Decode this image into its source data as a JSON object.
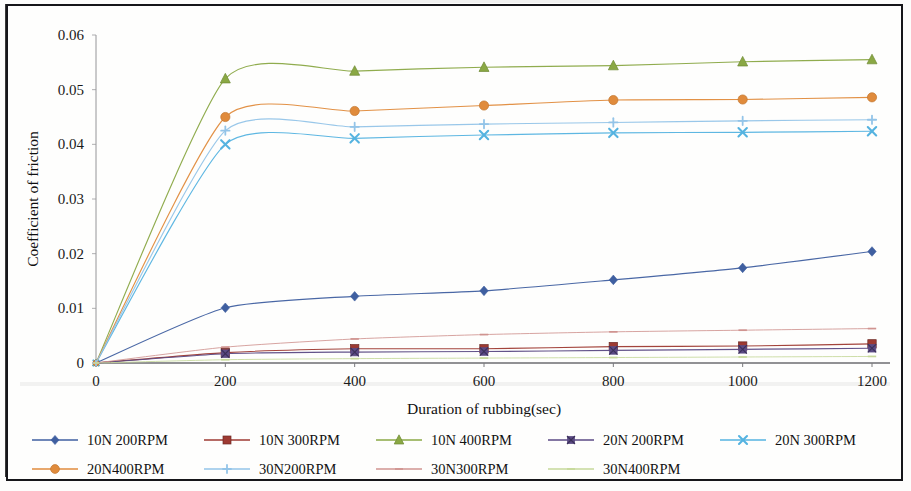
{
  "chart_data": {
    "type": "line",
    "title": "",
    "xlabel": "Duration of rubbing(sec)",
    "ylabel": "Coefficient of friction",
    "x": [
      0,
      200,
      400,
      600,
      800,
      1000,
      1200
    ],
    "xlim": [
      0,
      1200
    ],
    "ylim": [
      0,
      0.06
    ],
    "xticks": [
      "0",
      "200",
      "400",
      "600",
      "800",
      "1000",
      "1200"
    ],
    "yticks": [
      "0",
      "0.01",
      "0.02",
      "0.03",
      "0.04",
      "0.05",
      "0.06"
    ],
    "xtick_values": [
      0,
      200,
      400,
      600,
      800,
      1000,
      1200
    ],
    "ytick_values": [
      0,
      0.01,
      0.02,
      0.03,
      0.04,
      0.05,
      0.06
    ],
    "grid": false,
    "legend_position": "bottom",
    "smoothed": true,
    "series": [
      {
        "name": "10N 200RPM",
        "color": "#3f5fa0",
        "marker": "diamond",
        "values": [
          0,
          0.0101,
          0.0122,
          0.0132,
          0.0152,
          0.0174,
          0.0204
        ]
      },
      {
        "name": "10N 300RPM",
        "color": "#9e3a32",
        "marker": "square",
        "values": [
          0,
          0.0019,
          0.0026,
          0.0026,
          0.003,
          0.0031,
          0.0035
        ]
      },
      {
        "name": "10N 400RPM",
        "color": "#8aa844",
        "marker": "triangle",
        "values": [
          0,
          0.052,
          0.0534,
          0.0541,
          0.0544,
          0.0551,
          0.0555
        ]
      },
      {
        "name": "20N 200RPM",
        "color": "#5b4a84",
        "marker": "x-square",
        "values": [
          0,
          0.0017,
          0.002,
          0.0021,
          0.0023,
          0.0025,
          0.0027
        ]
      },
      {
        "name": "20N 300RPM",
        "color": "#55b3e0",
        "marker": "x",
        "values": [
          0,
          0.04,
          0.0411,
          0.0417,
          0.0421,
          0.0422,
          0.0424
        ]
      },
      {
        "name": "20N400RPM",
        "color": "#e08b3c",
        "marker": "circle",
        "values": [
          0,
          0.045,
          0.0461,
          0.0471,
          0.0481,
          0.0482,
          0.0486
        ]
      },
      {
        "name": "30N200RPM",
        "color": "#93c4e8",
        "marker": "plus",
        "values": [
          0,
          0.0425,
          0.0432,
          0.0437,
          0.044,
          0.0443,
          0.0445
        ]
      },
      {
        "name": "30N300RPM",
        "color": "#d09490",
        "marker": "dash",
        "values": [
          0,
          0.0029,
          0.0044,
          0.0052,
          0.0057,
          0.006,
          0.0063
        ]
      },
      {
        "name": "30N400RPM",
        "color": "#c6d89a",
        "marker": "dash",
        "values": [
          0,
          0.0006,
          0.0008,
          0.0009,
          0.001,
          0.0011,
          0.0012
        ]
      }
    ]
  },
  "legend": {
    "rows": [
      [
        "10N 200RPM",
        "10N 300RPM",
        "10N 400RPM",
        "20N 200RPM",
        "20N 300RPM"
      ],
      [
        "20N400RPM",
        "30N200RPM",
        "30N300RPM",
        "30N400RPM"
      ]
    ]
  }
}
